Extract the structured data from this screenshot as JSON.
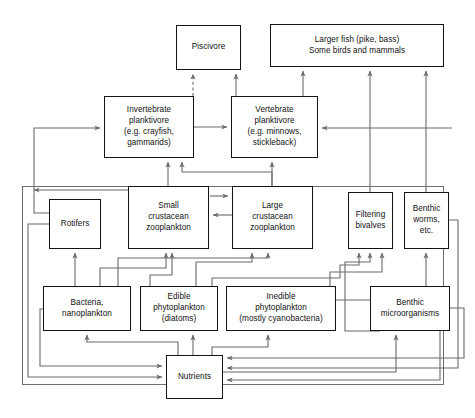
{
  "diagram": {
    "style": {
      "box_border_color": "#141414",
      "arrow_color": "#6b6b6b",
      "frame_color": "#6e6e6e",
      "background": "#ffffff",
      "text_color": "#111111"
    },
    "nodes": [
      {
        "id": "piscivore",
        "label": "Piscivore",
        "x": 176,
        "y": 25,
        "w": 65,
        "h": 45
      },
      {
        "id": "larger_fish",
        "label": "Larger fish (pike, bass)\nSome birds and mammals",
        "x": 270,
        "y": 24,
        "w": 174,
        "h": 43
      },
      {
        "id": "invert_plank",
        "label": "Invertebrate\nplanktivore\n(e.g. crayfish,\ngammarids)",
        "x": 104,
        "y": 96,
        "w": 90,
        "h": 62
      },
      {
        "id": "vert_plank",
        "label": "Vertebrate\nplanktivore\n(e.g. minnows,\nstickleback)",
        "x": 231,
        "y": 96,
        "w": 87,
        "h": 62
      },
      {
        "id": "rotifers",
        "label": "Rotifers",
        "x": 49,
        "y": 199,
        "w": 52,
        "h": 50
      },
      {
        "id": "small_crust",
        "label": "Small\ncrustacean\nzooplankton",
        "x": 128,
        "y": 186,
        "w": 81,
        "h": 63
      },
      {
        "id": "large_crust",
        "label": "Large\ncrustacean\nzooplankton",
        "x": 232,
        "y": 186,
        "w": 81,
        "h": 63
      },
      {
        "id": "filtering_biv",
        "label": "Filtering\nbivalves",
        "x": 348,
        "y": 192,
        "w": 45,
        "h": 57
      },
      {
        "id": "benthic_worms",
        "label": "Benthic\nworms,\netc.",
        "x": 404,
        "y": 192,
        "w": 45,
        "h": 57
      },
      {
        "id": "bacteria",
        "label": "Bacteria,\nnanoplankton",
        "x": 43,
        "y": 286,
        "w": 88,
        "h": 45
      },
      {
        "id": "edible_phyto",
        "label": "Edible\nphytoplankton\n(diatoms)",
        "x": 140,
        "y": 286,
        "w": 78,
        "h": 45
      },
      {
        "id": "inedible_phyto",
        "label": "Inedible\nphytoplankton\n(mostly cyanobacteria)",
        "x": 226,
        "y": 286,
        "w": 110,
        "h": 45
      },
      {
        "id": "benthic_micro",
        "label": "Benthic\nmicroorganisms",
        "x": 370,
        "y": 286,
        "w": 80,
        "h": 45
      },
      {
        "id": "nutrients",
        "label": "Nutrients",
        "x": 166,
        "y": 355,
        "w": 57,
        "h": 44
      }
    ],
    "frames": [
      {
        "id": "outer-frame",
        "x": 22,
        "y": 186,
        "w": 422,
        "h": 199
      }
    ],
    "edges": [
      {
        "from": "invert_plank",
        "to": "piscivore",
        "style": "dashed"
      },
      {
        "from": "vert_plank",
        "to": "piscivore",
        "style": "solid"
      },
      {
        "from": "vert_plank",
        "to": "larger_fish",
        "style": "solid"
      },
      {
        "from": "filtering_biv",
        "to": "larger_fish",
        "style": "solid"
      },
      {
        "from": "benthic_worms",
        "to": "larger_fish",
        "style": "solid"
      },
      {
        "from": "invert_plank",
        "to": "vert_plank",
        "style": "solid"
      },
      {
        "from": "small_crust",
        "to": "invert_plank",
        "style": "solid"
      },
      {
        "from": "large_crust",
        "to": "invert_plank",
        "style": "solid"
      },
      {
        "from": "rotifers",
        "to": "invert_plank",
        "style": "solid"
      },
      {
        "from": "large_crust",
        "to": "vert_plank",
        "style": "solid"
      },
      {
        "from": "small_crust",
        "to": "large_crust",
        "style": "solid"
      },
      {
        "from": "large_crust",
        "to": "small_crust",
        "style": "solid"
      },
      {
        "from": "bacteria",
        "to": "rotifers",
        "style": "solid"
      },
      {
        "from": "bacteria",
        "to": "small_crust",
        "style": "solid"
      },
      {
        "from": "edible_phyto",
        "to": "small_crust",
        "style": "solid"
      },
      {
        "from": "edible_phyto",
        "to": "large_crust",
        "style": "solid"
      },
      {
        "from": "bacteria",
        "to": "large_crust",
        "style": "solid"
      },
      {
        "from": "edible_phyto",
        "to": "filtering_biv",
        "style": "solid"
      },
      {
        "from": "inedible_phyto",
        "to": "filtering_biv",
        "style": "solid"
      },
      {
        "from": "benthic_micro",
        "to": "benthic_worms",
        "style": "solid"
      },
      {
        "from": "benthic_micro",
        "to": "filtering_biv",
        "style": "solid"
      },
      {
        "from": "nutrients",
        "to": "bacteria",
        "style": "solid"
      },
      {
        "from": "nutrients",
        "to": "edible_phyto",
        "style": "solid"
      },
      {
        "from": "nutrients",
        "to": "inedible_phyto",
        "style": "solid"
      },
      {
        "from": "nutrients",
        "to": "benthic_micro",
        "style": "solid"
      },
      {
        "from": "rotifers",
        "to": "nutrients",
        "style": "solid"
      },
      {
        "from": "bacteria",
        "to": "nutrients",
        "style": "solid"
      },
      {
        "from": "inedible_phyto",
        "to": "nutrients",
        "style": "solid"
      },
      {
        "from": "benthic_worms",
        "to": "nutrients",
        "style": "solid"
      },
      {
        "from": "benthic_micro",
        "to": "nutrients",
        "style": "solid"
      }
    ]
  }
}
